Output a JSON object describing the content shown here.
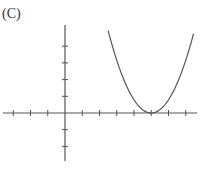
{
  "figure": {
    "label": "(C)",
    "colors": {
      "axis": "#555555",
      "curve": "#555555",
      "background": "#ffffff"
    }
  },
  "chart_data": {
    "type": "line",
    "title": "(C)",
    "xlabel": "",
    "ylabel": "",
    "x_ticks": [
      -3,
      -2,
      -1,
      1,
      2,
      3,
      4,
      5,
      6,
      7
    ],
    "y_ticks": [
      -2,
      -1,
      1,
      2,
      3,
      4
    ],
    "xlim": [
      -3.7,
      7.5
    ],
    "ylim": [
      -3.0,
      5.0
    ],
    "tick_labels": "none",
    "grid": false,
    "series": [
      {
        "name": "parabola",
        "equation_form": "y = a(x - 5)^2",
        "vertex": [
          5,
          0
        ],
        "x": [
          2.5,
          3,
          4,
          5,
          6,
          7.4
        ],
        "y": [
          4.9,
          3.1,
          0.8,
          0,
          0.8,
          5.1
        ]
      }
    ]
  }
}
